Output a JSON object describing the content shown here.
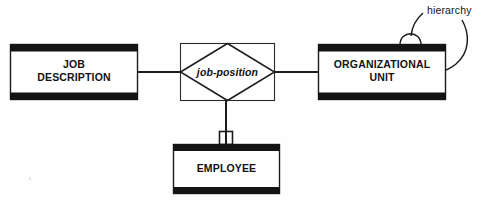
{
  "diagram": {
    "type": "entity-relationship-diagram",
    "notation": "chen-style",
    "background_color": "#fefefe",
    "line_color": "#1a1a1a",
    "bar_color": "#111111",
    "entities": [
      {
        "id": "job-description",
        "label": "JOB\nDESCRIPTION",
        "x": 10,
        "y": 44,
        "width": 128,
        "height": 56
      },
      {
        "id": "organizational-unit",
        "label": "ORGANIZATIONAL\nUNIT",
        "x": 318,
        "y": 44,
        "width": 128,
        "height": 56
      },
      {
        "id": "employee",
        "label": "EMPLOYEE",
        "x": 173,
        "y": 144,
        "width": 107,
        "height": 50
      }
    ],
    "relationships": [
      {
        "id": "job-position",
        "label": "job-position",
        "style": "diamond-in-rectangle",
        "x": 180,
        "y": 43,
        "width": 95,
        "height": 58
      },
      {
        "id": "hierarchy",
        "label": "hierarchy",
        "style": "recursive-loop",
        "attached_to": "organizational-unit",
        "label_x": 427,
        "label_y": 4
      }
    ],
    "connectors": [
      {
        "id": "jobdesc-to-jobposition",
        "from": "job-description",
        "to": "job-position"
      },
      {
        "id": "jobposition-to-orgunit",
        "from": "job-position",
        "to": "organizational-unit"
      },
      {
        "id": "jobposition-to-employee",
        "from": "job-position",
        "to": "employee",
        "marker": "small-square"
      }
    ]
  }
}
